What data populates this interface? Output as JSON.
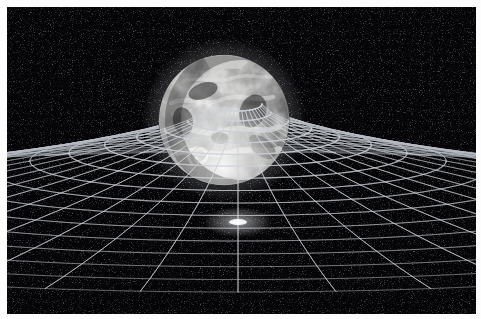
{
  "image": {
    "title": "Spacetime curvature around the Earth",
    "subject": "earth-gravity-well",
    "medium": "grayscale-astronomy-illustration",
    "frame_border_color": "#ffffff",
    "background_color": "#050507",
    "width_px": 481,
    "height_px": 319
  },
  "scene": {
    "background": {
      "name": "starfield",
      "color": "#050507",
      "star_color": "#9aa0a8",
      "star_count": 420,
      "description": "Deep black space with faint scattered star speckle"
    },
    "planet": {
      "name": "Earth",
      "label": "Earth",
      "center_x": 217,
      "center_y": 113,
      "radius": 65,
      "palette": {
        "highlight": "#f4f4f2",
        "midtone": "#9c9c9a",
        "shadow": "#2b2b2c",
        "limb": "#d8d8d6"
      },
      "features": [
        "swirling cloud bands",
        "bright polar cloud cap at lower limb",
        "dark ocean and landmass mottling",
        "bright cloud vortex lower left"
      ]
    },
    "grid": {
      "name": "spacetime-fabric-grid",
      "line_color": "#c8ccd2",
      "ring_count": 16,
      "spoke_count": 40,
      "funnel_center_x": 231,
      "funnel_center_y": 215,
      "throat_radius_x": 24,
      "throat_radius_y": 7,
      "perspective_squash": 0.42,
      "description": "Concentric rings and radial spokes forming a funnel-shaped gravity well beneath the planet"
    },
    "glow": {
      "name": "throat-glow",
      "color": "#ffffff",
      "center_x": 231,
      "center_y": 215,
      "radius": 30
    }
  },
  "annotations": {
    "alt_text": "Illustration of the Earth resting in a curved grid of spacetime, forming a gravity well funnel",
    "concept": "General relativity — mass warping spacetime"
  }
}
